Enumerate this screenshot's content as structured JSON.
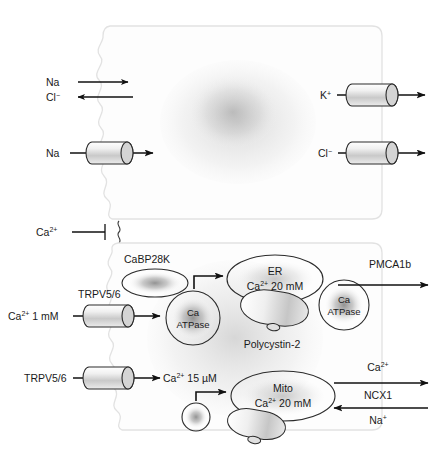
{
  "colors": {
    "ink": "#1a1a1a",
    "outline": "#e2e2e2",
    "organelle_stroke": "#2b2b2b",
    "channel_fill": "#d9d9d9",
    "blob_fill": "#9a9a9a"
  },
  "upper_cell": {
    "name": "upper-epithelial-cell",
    "apical_transport": {
      "na_label": "Na",
      "cl_label": "Cl⁻"
    },
    "na_channel": {
      "label": "Na",
      "icon": "channel-cylinder"
    },
    "k_channel": {
      "label": "K⁺",
      "icon": "channel-cylinder"
    },
    "cl_channel": {
      "label": "Cl⁻",
      "icon": "channel-cylinder"
    }
  },
  "inhibition": {
    "label": "Ca",
    "superscript": "2+",
    "full_label": "Ca2+",
    "icon": "inhibition-tbar-arrow"
  },
  "lower_cell": {
    "name": "lower-epithelial-cell",
    "cabp": {
      "label": "CaBP28K",
      "shape": "ellipse"
    },
    "trpv_upper": {
      "channel_label": "TRPV5/6",
      "source_label": "Ca",
      "source_sup": "2+",
      "source_conc": " 1 mM",
      "full_source": "Ca2+ 1 mM"
    },
    "trpv_lower": {
      "channel_label": "TRPV5/6",
      "target_label": "Ca",
      "target_sup": "2+",
      "target_conc": " 15 µM",
      "full_target": "Ca2+ 15 µM"
    },
    "ca_atpase_left": {
      "line1": "Ca",
      "line2": "ATPase",
      "shape": "circle"
    },
    "ca_atpase_right": {
      "line1": "Ca",
      "line2": "ATPase",
      "shape": "circle"
    },
    "er": {
      "line1": "ER",
      "line2_prefix": "Ca",
      "line2_sup": "2+",
      "line2_suffix": " 20 mM",
      "line2_full": "Ca2+ 20 mM",
      "shape": "ellipse"
    },
    "polycystin": {
      "label": "Polycystin-2",
      "icon": "cylinder-channel"
    },
    "mito": {
      "line1": "Mito",
      "line2_prefix": "Ca",
      "line2_sup": "2+",
      "line2_suffix": " 20 mM",
      "line2_full": "Ca2+ 20 mM",
      "shape": "ellipse"
    },
    "pmca": {
      "label": "PMCA1b"
    },
    "ncx": {
      "ca_label": "Ca",
      "ca_sup": "2+",
      "name_label": "NCX1",
      "na_label": "Na",
      "na_sup": "+"
    },
    "vesicle": {
      "label": "",
      "shape": "circle"
    }
  }
}
